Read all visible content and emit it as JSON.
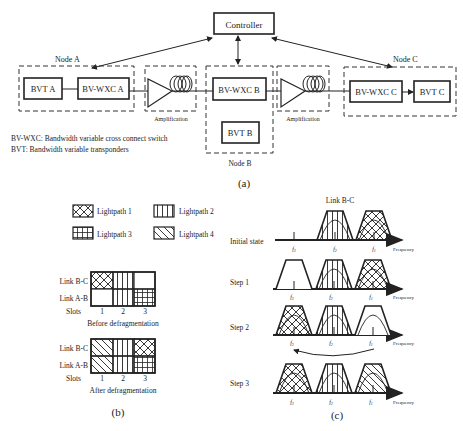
{
  "panel_a": {
    "controller": "Controller",
    "node_a": {
      "label": "Node A",
      "bvt": "BVT A",
      "bvwxc": "BV-WXC A"
    },
    "node_b": {
      "label": "Node B",
      "bvt": "BVT B",
      "bvwxc": "BV-WXC B"
    },
    "node_c": {
      "label": "Node C",
      "bvt": "BVT C",
      "bvwxc": "BV-WXC C"
    },
    "amplification_1": "Amplification",
    "amplification_2": "Amplification",
    "legend_1": "BV-WXC: Bandwidth variable cross connect switch",
    "legend_2": "BVT: Bandwidth variable transponders",
    "caption": "(a)"
  },
  "panel_b": {
    "legend": {
      "lp1": "Lightpath 1",
      "lp2": "Lightpath 2",
      "lp3": "Lightpath 3",
      "lp4": "Lightpath 4"
    },
    "before": {
      "row1": "Link B-C",
      "row2": "Link A-B",
      "slots_label": "Slots",
      "slots": [
        "1",
        "2",
        "3"
      ],
      "title": "Before defragmentation"
    },
    "after": {
      "row1": "Link B-C",
      "row2": "Link A-B",
      "slots_label": "Slots",
      "slots": [
        "1",
        "2",
        "3"
      ],
      "title": "After defragmentation"
    },
    "caption": "(b)"
  },
  "panel_c": {
    "title": "Link B-C",
    "rows": [
      {
        "label": "Initial state",
        "axis": "Frequency",
        "f": [
          "f3",
          "f2",
          "f1"
        ]
      },
      {
        "label": "Step 1",
        "axis": "Frequency",
        "f": [
          "f3",
          "f2",
          "f1"
        ]
      },
      {
        "label": "Step 2",
        "axis": "Frequency",
        "f": [
          "f3",
          "f2",
          "f1"
        ]
      },
      {
        "label": "Step 3",
        "axis": "Frequency",
        "f": [
          "f3",
          "f2",
          "f1"
        ]
      }
    ],
    "caption": "(c)"
  }
}
